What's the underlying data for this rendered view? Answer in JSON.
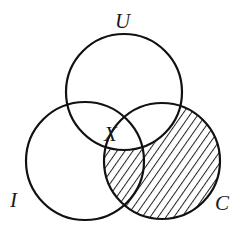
{
  "diagram": {
    "type": "venn",
    "sets": [
      {
        "id": "U",
        "label": "U",
        "cx": 124,
        "cy": 92,
        "r": 58,
        "label_x": 122,
        "label_y": 28
      },
      {
        "id": "I",
        "label": "I",
        "cx": 85,
        "cy": 161,
        "r": 59,
        "label_x": 16,
        "label_y": 207
      },
      {
        "id": "C",
        "label": "C",
        "cx": 162,
        "cy": 161,
        "r": 58,
        "label_x": 223,
        "label_y": 210
      }
    ],
    "region_label": {
      "label": "X",
      "x": 112,
      "y": 141
    },
    "shaded_region": "C minus U",
    "colors": {
      "stroke": "#111111",
      "hatch": "#222222",
      "background": "#ffffff"
    }
  }
}
